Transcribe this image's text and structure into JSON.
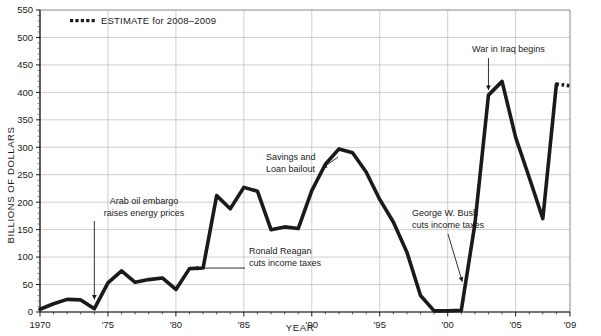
{
  "chart_data": {
    "type": "line",
    "title": "",
    "xlabel": "YEAR",
    "ylabel": "BILLIONS OF DOLLARS",
    "xlim": [
      1970,
      2009
    ],
    "ylim": [
      0,
      550
    ],
    "ytick_step": 50,
    "grid": true,
    "legend_position": "top-left",
    "x": [
      1970,
      1971,
      1972,
      1973,
      1974,
      1975,
      1976,
      1977,
      1978,
      1979,
      1980,
      1981,
      1982,
      1983,
      1984,
      1985,
      1986,
      1987,
      1988,
      1989,
      1990,
      1991,
      1992,
      1993,
      1994,
      1995,
      1996,
      1997,
      1998,
      1999,
      2000,
      2001,
      2002,
      2003,
      2004,
      2005,
      2006,
      2007,
      2008,
      2009
    ],
    "values": [
      5,
      15,
      23,
      22,
      6,
      53,
      75,
      54,
      59,
      62,
      41,
      79,
      80,
      212,
      188,
      227,
      220,
      150,
      155,
      152,
      221,
      269,
      297,
      290,
      255,
      205,
      164,
      109,
      30,
      2,
      2,
      3,
      160,
      395,
      420,
      318,
      245,
      170,
      415,
      412
    ],
    "yticks": [
      0,
      50,
      100,
      150,
      200,
      250,
      300,
      350,
      400,
      450,
      500,
      550
    ],
    "ytick_labels": [
      "0",
      "50",
      "100",
      "150",
      "200",
      "250",
      "300",
      "350",
      "400",
      "450",
      "500",
      "550"
    ],
    "xticks": [
      1970,
      1975,
      1980,
      1985,
      1990,
      1995,
      2000,
      2005,
      2009
    ],
    "xtick_labels": [
      "1970",
      "'75",
      "'80",
      "'85",
      "'90",
      "'95",
      "'00",
      "'05",
      "'09"
    ],
    "series": [
      {
        "name": "Actual",
        "style": "solid",
        "from": 1970,
        "to": 2008
      },
      {
        "name": "ESTIMATE for 2008–2009",
        "style": "dotted",
        "from": 2008,
        "to": 2009
      }
    ],
    "line_color": "#1a1a1a",
    "grid_color": "#b9b9b9",
    "annotations": [
      {
        "id": "arab-oil-embargo",
        "text_line1": "Arab oil embargo",
        "text_line2": "raises energy prices",
        "points_to_year": 1974,
        "points_to_value": 30
      },
      {
        "id": "ronald-reagan",
        "text_line1": "Ronald Reagan",
        "text_line2": "cuts income taxes",
        "points_to_year": 1981,
        "points_to_value": 80
      },
      {
        "id": "savings-loan-bailout",
        "text_line1": "Savings and",
        "text_line2": "Loan bailout",
        "points_to_year": 1991,
        "points_to_value": 262
      },
      {
        "id": "george-w-bush",
        "text_line1": "George W. Bush",
        "text_line2": "cuts income taxes",
        "points_to_year": 2001,
        "points_to_value": 55
      },
      {
        "id": "war-in-iraq",
        "text_line1": "War in Iraq begins",
        "text_line2": "",
        "points_to_year": 2003,
        "points_to_value": 395
      }
    ]
  },
  "legend": {
    "estimate_label": "ESTIMATE for 2008–2009",
    "marker": "dotted-square-marker"
  },
  "axes": {
    "y_title": "BILLIONS OF DOLLARS",
    "x_title": "YEAR"
  }
}
